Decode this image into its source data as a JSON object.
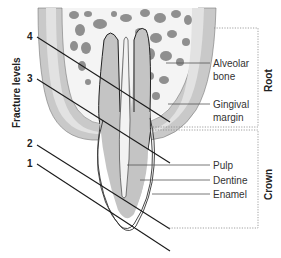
{
  "figure": {
    "axis_title": "Fracture levels",
    "fracture_levels": [
      "1",
      "2",
      "3",
      "4"
    ],
    "labels": {
      "alveolar_bone": [
        "Alveolar",
        "bone"
      ],
      "gingival_margin": [
        "Gingival",
        "margin"
      ],
      "pulp": "Pulp",
      "dentine": "Dentine",
      "enamel": "Enamel"
    },
    "regions": {
      "root": "Root",
      "crown": "Crown"
    }
  },
  "colors": {
    "gum": "#c9c9c9",
    "gum_inner": "#e2e2e2",
    "bone_spot": "#8f8f8f",
    "dentine": "#c4c4c4",
    "enamel": "#ffffff",
    "line": "#1a1a1a",
    "leader": "#555555"
  }
}
